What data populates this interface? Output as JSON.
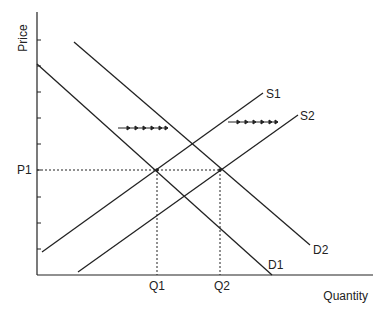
{
  "axes": {
    "y_label": "Price",
    "x_label": "Quantity",
    "y_tick_count": 9
  },
  "labels": {
    "p1": "P1",
    "q1": "Q1",
    "q2": "Q2",
    "s1": "S1",
    "s2": "S2",
    "d1": "D1",
    "d2": "D2"
  },
  "curves": [
    {
      "name": "D1",
      "type": "demand",
      "from": [
        37,
        64
      ],
      "to": [
        272,
        275
      ]
    },
    {
      "name": "D2",
      "type": "demand",
      "from": [
        74,
        42
      ],
      "to": [
        310,
        245
      ]
    },
    {
      "name": "S1",
      "type": "supply",
      "from": [
        42,
        252
      ],
      "to": [
        263,
        93
      ]
    },
    {
      "name": "S2",
      "type": "supply",
      "from": [
        78,
        272
      ],
      "to": [
        298,
        115
      ]
    }
  ],
  "equilibria": [
    {
      "price": "P1",
      "quantity": "Q1",
      "point": [
        157,
        170
      ]
    },
    {
      "price": "P1",
      "quantity": "Q2",
      "point": [
        220,
        170
      ]
    }
  ],
  "shift_arrows": [
    {
      "describes": "demand shift right",
      "from": [
        118,
        128
      ],
      "to": [
        168,
        128
      ]
    },
    {
      "describes": "supply shift right",
      "from": [
        228,
        122
      ],
      "to": [
        278,
        122
      ]
    }
  ],
  "colors": {
    "line": "#222222",
    "background": "#ffffff"
  }
}
